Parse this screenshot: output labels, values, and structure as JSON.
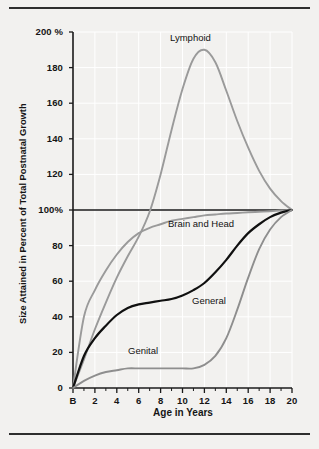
{
  "figure": {
    "background_color": "#f2f1ef",
    "rule_color": "#2e2e2e"
  },
  "chart_data": {
    "type": "line",
    "title": "",
    "xlabel": "Age in Years",
    "ylabel": "Size Attained in Percent of Total Postnatal Growth",
    "xlim": [
      0,
      20
    ],
    "ylim": [
      0,
      200
    ],
    "grid": true,
    "legend_position": "inline-annotations",
    "x_tick_labels": [
      "B",
      "2",
      "4",
      "6",
      "8",
      "10",
      "12",
      "14",
      "16",
      "18",
      "20"
    ],
    "x_tick_values": [
      0,
      2,
      4,
      6,
      8,
      10,
      12,
      14,
      16,
      18,
      20
    ],
    "x_minor_ticks": [
      1,
      3,
      5,
      7,
      9,
      11,
      13,
      15,
      17,
      19
    ],
    "y_tick_labels": [
      "0",
      "20",
      "40",
      "60",
      "80",
      "100%",
      "120",
      "140",
      "160",
      "180",
      "200 %"
    ],
    "y_tick_values": [
      0,
      20,
      40,
      60,
      80,
      100,
      120,
      140,
      160,
      180,
      200
    ],
    "reference_line": {
      "value": 100,
      "label": "100%",
      "color": "#1a1a1a"
    },
    "x": [
      0,
      1,
      2,
      3,
      4,
      5,
      6,
      7,
      8,
      9,
      10,
      11,
      12,
      13,
      14,
      15,
      16,
      17,
      18,
      19,
      20
    ],
    "series": [
      {
        "name": "Lymphoid",
        "color": "#9a9a9a",
        "label": "Lymphoid",
        "values": [
          0,
          16,
          33,
          48,
          62,
          74,
          85,
          99,
          120,
          145,
          168,
          185,
          190,
          183,
          167,
          150,
          135,
          122,
          112,
          105,
          100
        ]
      },
      {
        "name": "Brain and Head",
        "color": "#9a9a9a",
        "label": "Brain and Head",
        "values": [
          0,
          40,
          55,
          66,
          75,
          82,
          87,
          90,
          92,
          94,
          95,
          96,
          97,
          97.5,
          98,
          98.3,
          98.7,
          99,
          99.3,
          99.7,
          100
        ]
      },
      {
        "name": "General",
        "color": "#101010",
        "label": "General",
        "values": [
          0,
          18,
          28,
          35,
          41,
          45,
          47,
          48,
          49,
          50,
          52,
          55,
          59,
          65,
          72,
          80,
          87,
          92,
          96,
          98.5,
          100
        ]
      },
      {
        "name": "Genital",
        "color": "#8e8e8e",
        "label": "Genital",
        "values": [
          0,
          4,
          7,
          9,
          10,
          11,
          11,
          11,
          11,
          11,
          11,
          11,
          13,
          18,
          28,
          44,
          62,
          78,
          89,
          96,
          100
        ]
      }
    ],
    "annotations": [
      {
        "text": "Lymphoid",
        "x_px": 168,
        "y_px": 32
      },
      {
        "text": "Brain and Head",
        "x_px": 166,
        "y_px": 218
      },
      {
        "text": "General",
        "x_px": 190,
        "y_px": 295
      },
      {
        "text": "Genital",
        "x_px": 126,
        "y_px": 345
      }
    ]
  }
}
